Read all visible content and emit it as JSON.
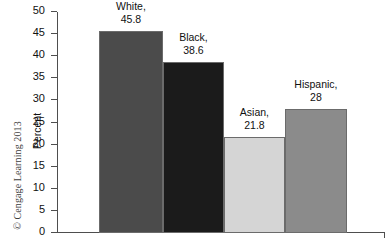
{
  "credit": "© Cengage Learning 2013",
  "chart_data": {
    "type": "bar",
    "title": "",
    "xlabel": "",
    "ylabel": "Percent",
    "ylim": [
      0,
      50
    ],
    "ytick_step": 5,
    "yticks": [
      50,
      45,
      40,
      35,
      30,
      25,
      20,
      15,
      10,
      5,
      0
    ],
    "grid": false,
    "legend": false,
    "categories": [
      "White",
      "Black",
      "Asian",
      "Hispanic"
    ],
    "values": [
      45.8,
      38.6,
      21.8,
      28
    ],
    "bar_labels": [
      "White,\n45.8",
      "Black,\n38.6",
      "Asian,\n21.8",
      "Hispanic,\n28"
    ],
    "bars": [
      {
        "category": "White",
        "value": 45.8,
        "value_text": "45.8",
        "label_line1": "White,",
        "label_line2": "45.8",
        "color": "#4b4b4b",
        "edge": "#6b6b6b",
        "x_pct": 12.8,
        "w_pct": 19.5
      },
      {
        "category": "Black",
        "value": 38.6,
        "value_text": "38.6",
        "label_line1": "Black,",
        "label_line2": "38.6",
        "color": "#1b1b1b",
        "edge": "#6b6b6b",
        "x_pct": 32.3,
        "w_pct": 18.6
      },
      {
        "category": "Asian",
        "value": 21.8,
        "value_text": "21.8",
        "label_line1": "Asian,",
        "label_line2": "21.8",
        "color": "#d5d5d5",
        "edge": "#6b6b6b",
        "x_pct": 50.9,
        "w_pct": 18.6
      },
      {
        "category": "Hispanic",
        "value": 28,
        "value_text": "28",
        "label_line1": "Hispanic,",
        "label_line2": "28",
        "color": "#8b8b8b",
        "edge": "#6b6b6b",
        "x_pct": 69.5,
        "w_pct": 18.9
      }
    ]
  }
}
